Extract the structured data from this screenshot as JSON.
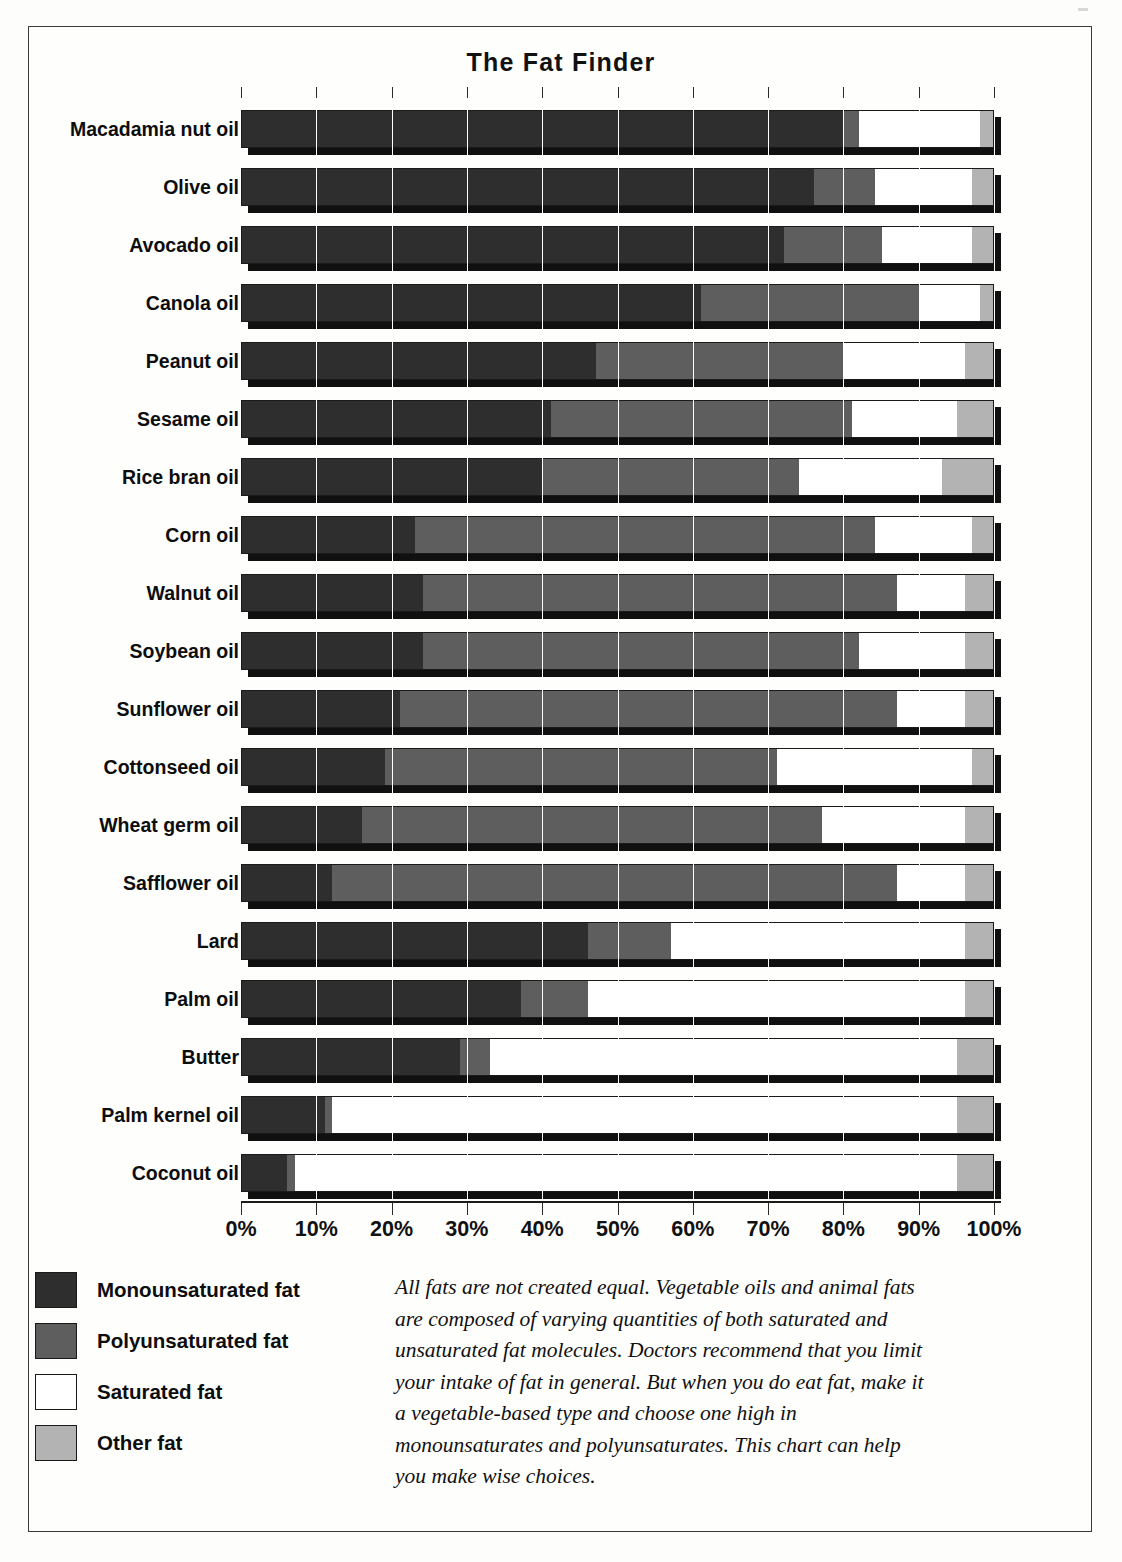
{
  "chart_data": {
    "type": "bar",
    "subtype": "stacked-horizontal-100pct",
    "title": "The Fat Finder",
    "xlabel": "",
    "ylabel": "",
    "xlim": [
      0,
      100
    ],
    "grid": true,
    "legend_position": "bottom-left",
    "x_tick_labels": [
      "0%",
      "10%",
      "20%",
      "30%",
      "40%",
      "50%",
      "60%",
      "70%",
      "80%",
      "90%",
      "100%"
    ],
    "x_tick_values": [
      0,
      10,
      20,
      30,
      40,
      50,
      60,
      70,
      80,
      90,
      100
    ],
    "categories": [
      "Macadamia nut oil",
      "Olive oil",
      "Avocado oil",
      "Canola oil",
      "Peanut oil",
      "Sesame oil",
      "Rice bran oil",
      "Corn oil",
      "Walnut oil",
      "Soybean oil",
      "Sunflower oil",
      "Cottonseed oil",
      "Wheat germ oil",
      "Safflower oil",
      "Lard",
      "Palm oil",
      "Butter",
      "Palm kernel oil",
      "Coconut oil"
    ],
    "series": [
      {
        "name": "Monounsaturated fat",
        "color": "#2e2e2e",
        "values": [
          80,
          76,
          72,
          61,
          47,
          41,
          40,
          23,
          24,
          24,
          21,
          19,
          16,
          12,
          46,
          37,
          29,
          11,
          6
        ]
      },
      {
        "name": "Polyunsaturated fat",
        "color": "#5e5e5e",
        "values": [
          2,
          8,
          13,
          29,
          33,
          40,
          34,
          61,
          63,
          58,
          66,
          52,
          61,
          75,
          11,
          9,
          4,
          1,
          1
        ]
      },
      {
        "name": "Saturated fat",
        "color": "#ffffff",
        "values": [
          16,
          13,
          12,
          8,
          16,
          14,
          19,
          13,
          9,
          14,
          9,
          26,
          19,
          9,
          39,
          50,
          62,
          83,
          88
        ]
      },
      {
        "name": "Other fat",
        "color": "#b3b3b3",
        "values": [
          2,
          3,
          3,
          2,
          4,
          5,
          7,
          3,
          4,
          4,
          4,
          3,
          4,
          4,
          4,
          4,
          5,
          5,
          5
        ]
      }
    ]
  },
  "legend": {
    "items": [
      {
        "label": "Monounsaturated fat",
        "swatch_class": "sw-mono",
        "name": "legend-swatch-monounsaturated"
      },
      {
        "label": "Polyunsaturated fat",
        "swatch_class": "sw-poly",
        "name": "legend-swatch-polyunsaturated"
      },
      {
        "label": "Saturated fat",
        "swatch_class": "sw-sat",
        "name": "legend-swatch-saturated"
      },
      {
        "label": "Other fat",
        "swatch_class": "sw-other",
        "name": "legend-swatch-other"
      }
    ]
  },
  "caption": {
    "text": "All fats are not created equal. Vegetable oils and animal fats are composed of varying quantities of both saturated and unsaturated fat molecules. Doctors recommend that you limit your intake of fat in general. But when you do eat fat, make it a vegetable-based type and choose one high in monounsaturates and polyunsaturates. This chart can help you make wise choices."
  },
  "colors": {
    "monounsaturated": "#2e2e2e",
    "polyunsaturated": "#5e5e5e",
    "saturated": "#ffffff",
    "other": "#b3b3b3",
    "outline": "#1a1a1a",
    "shadow": "#101010"
  }
}
